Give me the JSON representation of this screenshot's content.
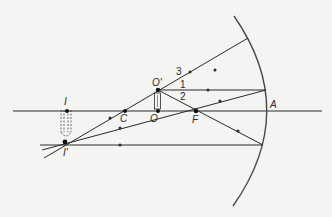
{
  "diagram": {
    "type": "concave-mirror-ray-diagram",
    "colors": {
      "background": "#f4f4f2",
      "line": "#2a2a2a",
      "mirror": "#4a4a4a"
    },
    "points": {
      "object_top": "O'",
      "object_base": "O",
      "center_of_curvature": "C",
      "focal_point": "F",
      "vertex": "A",
      "image_base": "I",
      "image_top": "I'"
    },
    "rays": [
      "1",
      "2",
      "3"
    ]
  }
}
